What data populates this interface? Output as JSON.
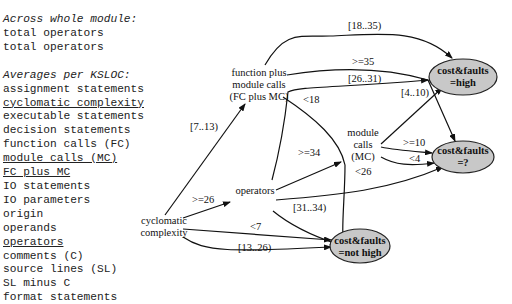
{
  "legend": {
    "section1_title": "Across whole module:",
    "section1_items": [
      {
        "label": "total operators",
        "underlined": false
      },
      {
        "label": "total operators",
        "underlined": false
      }
    ],
    "section2_title": "Averages per KSLOC:",
    "section2_items": [
      {
        "label": "assignment statements",
        "underlined": false
      },
      {
        "label": "cyclomatic complexity",
        "underlined": true
      },
      {
        "label": "executable statements",
        "underlined": false
      },
      {
        "label": "decision statements",
        "underlined": false
      },
      {
        "label": "function calls (FC)",
        "underlined": false
      },
      {
        "label": "module calls (MC)",
        "underlined": true
      },
      {
        "label": "FC plus MC",
        "underlined": true
      },
      {
        "label": "IO statements",
        "underlined": false
      },
      {
        "label": "IO parameters",
        "underlined": false
      },
      {
        "label": "origin",
        "underlined": false
      },
      {
        "label": "operands",
        "underlined": false
      },
      {
        "label": "operators",
        "underlined": true
      },
      {
        "label": "comments (C)",
        "underlined": false
      },
      {
        "label": "source lines (SL)",
        "underlined": false
      },
      {
        "label": "SL minus C",
        "underlined": false
      },
      {
        "label": "format statements",
        "underlined": false
      }
    ]
  },
  "tree": {
    "nodes": {
      "cyclomatic": [
        "cyclomatic",
        "complexity"
      ],
      "fcmc": [
        "function plus",
        "module calls",
        "(FC plus MC)"
      ],
      "operators": [
        "operators"
      ],
      "mc": [
        "module",
        "calls",
        "(MC)"
      ]
    },
    "leaves": {
      "high": [
        "cost&faults",
        "=high"
      ],
      "unknown": [
        "cost&faults",
        "=?"
      ],
      "nothigh": [
        "cost&faults",
        "=not high"
      ]
    },
    "edge_labels": {
      "cc_to_fcmc": "[7..13)",
      "cc_to_ops": ">=26",
      "cc_lt7": "<7",
      "cc_13_26": "[13..26)",
      "fcmc_18_35": "[18..35)",
      "fcmc_ge35": ">=35",
      "fcmc_lt18": "<18",
      "ops_26_31": "[26..31)",
      "ops_ge34": ">=34",
      "ops_31_34": "[31..34)",
      "ops_lt26": "<26",
      "mc_4_10": "[4..10)",
      "mc_ge10": ">=10",
      "mc_lt4": "<4"
    },
    "colors": {
      "leaf_fill": "#c8c8c8",
      "line": "#111111"
    }
  }
}
